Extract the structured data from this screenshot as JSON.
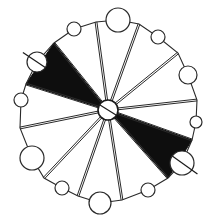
{
  "diagram": {
    "title": "",
    "colors": {
      "ink": "#2a2a2a",
      "fill": "#0e0e0e",
      "background": "#ffffff"
    },
    "hub": {
      "cx": 108,
      "cy": 110,
      "r": 10
    },
    "rim_vertices": [
      {
        "x": 139,
        "y": 24
      },
      {
        "x": 178,
        "y": 53
      },
      {
        "x": 197,
        "y": 100
      },
      {
        "x": 192,
        "y": 140
      },
      {
        "x": 168,
        "y": 178
      },
      {
        "x": 122,
        "y": 200
      },
      {
        "x": 78,
        "y": 196
      },
      {
        "x": 44,
        "y": 178
      },
      {
        "x": 20,
        "y": 128
      },
      {
        "x": 26,
        "y": 84
      },
      {
        "x": 54,
        "y": 43
      },
      {
        "x": 96,
        "y": 22
      }
    ],
    "nodes": [
      {
        "cx": 118,
        "cy": 20,
        "r": 12
      },
      {
        "cx": 158,
        "cy": 37,
        "r": 7
      },
      {
        "cx": 188,
        "cy": 75,
        "r": 9
      },
      {
        "cx": 196,
        "cy": 122,
        "r": 6
      },
      {
        "cx": 182,
        "cy": 163,
        "r": 12,
        "crossed": true
      },
      {
        "cx": 148,
        "cy": 190,
        "r": 7
      },
      {
        "cx": 100,
        "cy": 203,
        "r": 11
      },
      {
        "cx": 62,
        "cy": 188,
        "r": 7
      },
      {
        "cx": 32,
        "cy": 158,
        "r": 12
      },
      {
        "cx": 21,
        "cy": 100,
        "r": 7
      },
      {
        "cx": 37,
        "cy": 62,
        "r": 10,
        "crossed": true
      },
      {
        "cx": 74,
        "cy": 29,
        "r": 7
      }
    ],
    "filled_sectors": [
      {
        "from_vertex": 9,
        "to_vertex": 10
      },
      {
        "from_vertex": 3,
        "to_vertex": 4
      }
    ],
    "labels": []
  }
}
